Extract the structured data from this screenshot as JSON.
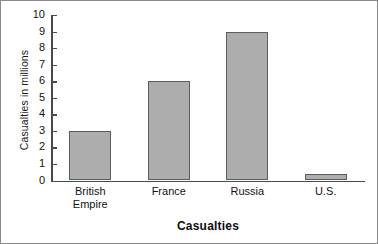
{
  "chart_data": {
    "type": "bar",
    "title": "",
    "xlabel": "Casualties",
    "ylabel": "Casualties in millions",
    "categories": [
      "British Empire",
      "France",
      "Russia",
      "U.S."
    ],
    "values": [
      3,
      6,
      9,
      0.4
    ],
    "ylim": [
      0,
      10
    ],
    "y_ticks": [
      10,
      9,
      8,
      7,
      6,
      5,
      4,
      3,
      2,
      1,
      0
    ],
    "y_tick_labels": [
      "10",
      "9",
      "8",
      "7",
      "6",
      "5",
      "4",
      "3",
      "2",
      "1",
      "0"
    ],
    "grid": false,
    "legend": null,
    "series": [
      {
        "name": "Casualties",
        "values": [
          3,
          6,
          9,
          0.4
        ]
      }
    ],
    "bar_color": "#adadad",
    "bar_border_color": "#5d5d5d",
    "axis_color": "#4a4a4a",
    "text_color": "#121212",
    "background": "#ffffff"
  },
  "category_lines": [
    [
      "British",
      "Empire"
    ],
    [
      "France"
    ],
    [
      "Russia"
    ],
    [
      "U.S."
    ]
  ]
}
